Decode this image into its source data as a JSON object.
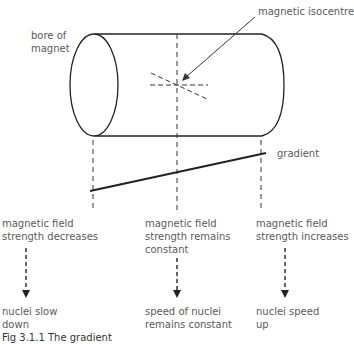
{
  "labels": {
    "bore": [
      "bore of",
      "magnet"
    ],
    "isocentre": "magnetic isocentre",
    "gradient": "gradient",
    "left_field": [
      "magnetic field",
      "strength decreases"
    ],
    "center_field": [
      "magnetic field",
      "strength remains",
      "constant"
    ],
    "right_field": [
      "magnetic field",
      "strength increases"
    ],
    "left_result": [
      "nuclei slow",
      "down"
    ],
    "center_result": [
      "speed of nuclei",
      "remains constant"
    ],
    "right_result": [
      "nuclei speed",
      "up"
    ],
    "caption_partial": "Fig 3.1.1 The gradient"
  },
  "colors": {
    "line": "#222222",
    "text": "#5a5a5a"
  }
}
